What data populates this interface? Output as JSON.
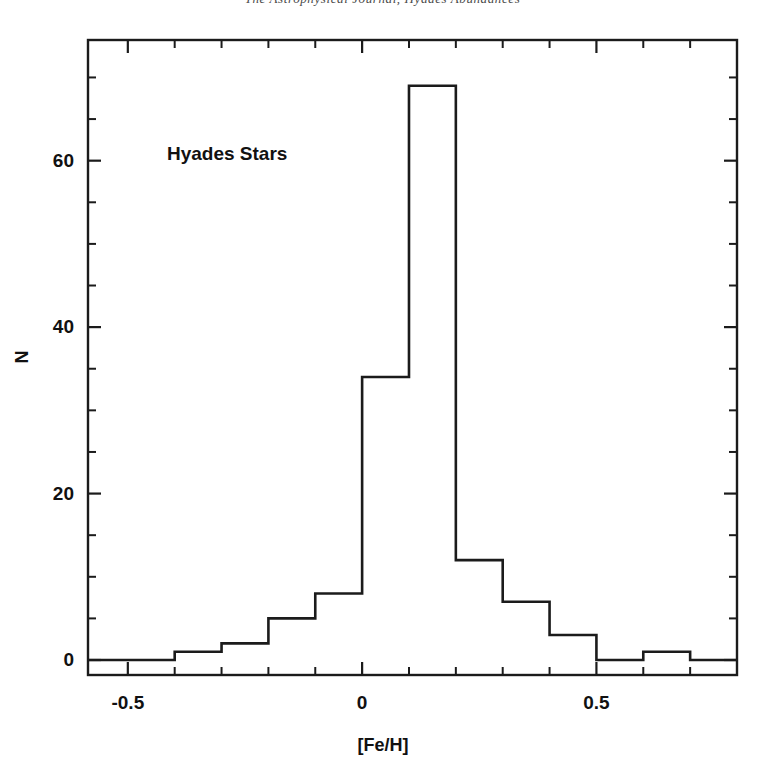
{
  "page": {
    "header_text": "The Astrophysical Journal, Hyades Abundances"
  },
  "figure": {
    "annotation": "Hyades Stars",
    "x_axis_label": "[Fe/H]",
    "y_axis_label": "N"
  },
  "axes": {
    "x_tick_labels": [
      "-0.5",
      "0",
      "0.5"
    ],
    "x_tick_values": [
      -0.5,
      0,
      0.5
    ],
    "y_tick_labels": [
      "0",
      "20",
      "40",
      "60"
    ],
    "y_tick_values": [
      0,
      20,
      40,
      60
    ]
  },
  "colors": {
    "ink": "#1b1b1b",
    "background": "#ffffff"
  },
  "chart_data": {
    "type": "bar",
    "title": "",
    "subtitle": "",
    "xlabel": "[Fe/H]",
    "ylabel": "N",
    "annotations": [
      "Hyades Stars"
    ],
    "legend": [],
    "legend_position": "none",
    "grid": false,
    "histogram": true,
    "bin_width": 0.1,
    "bin_edges": [
      -0.5,
      -0.4,
      -0.3,
      -0.2,
      -0.1,
      0.0,
      0.1,
      0.2,
      0.3,
      0.4,
      0.5,
      0.6,
      0.7,
      0.8
    ],
    "categories": [
      "-0.5 to -0.4",
      "-0.4 to -0.3",
      "-0.3 to -0.2",
      "-0.2 to -0.1",
      "-0.1 to 0.0",
      "0.0 to 0.1",
      "0.1 to 0.2",
      "0.2 to 0.3",
      "0.3 to 0.4",
      "0.4 to 0.5",
      "0.5 to 0.6",
      "0.6 to 0.7",
      "0.7 to 0.8"
    ],
    "values": [
      0,
      1,
      2,
      5,
      8,
      34,
      69,
      12,
      7,
      3,
      0,
      1,
      0
    ],
    "xlim": [
      -0.585,
      0.8
    ],
    "ylim": [
      -1.8,
      74.5
    ],
    "x_major_ticks": [
      -0.5,
      0.0,
      0.5
    ],
    "x_minor_tick_step": 0.1,
    "y_major_ticks": [
      0,
      20,
      40,
      60
    ],
    "y_minor_tick_step": 5
  }
}
